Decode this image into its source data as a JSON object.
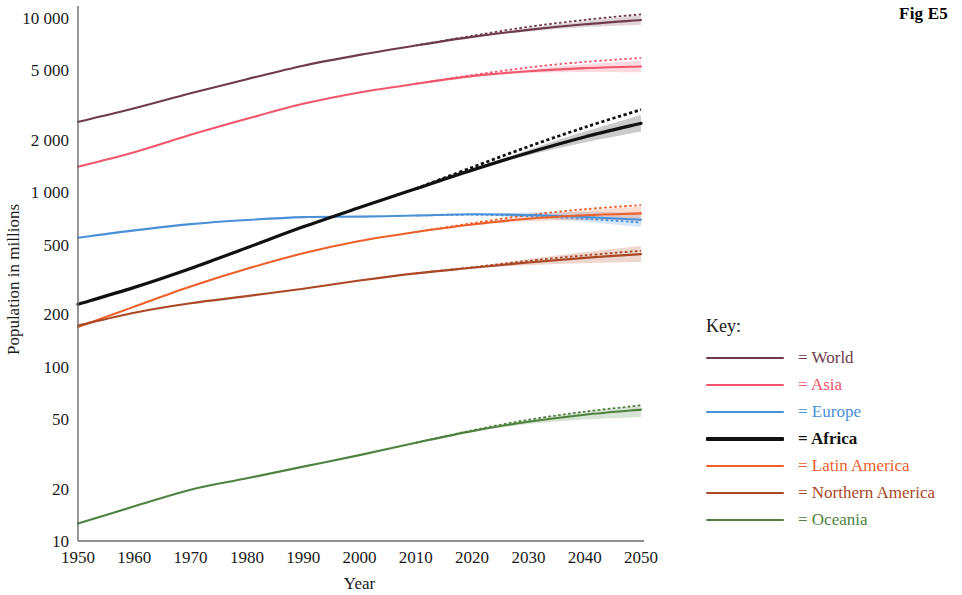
{
  "figure": {
    "label": "Fig E5"
  },
  "legend": {
    "title": "Key:",
    "prefix": "= ",
    "items": [
      {
        "label": "= World",
        "color": "#6e3b4b",
        "bold": false
      },
      {
        "label": "= Asia",
        "color": "#f2566d",
        "bold": false
      },
      {
        "label": "= Europe",
        "color": "#4a90d9",
        "bold": false
      },
      {
        "label": "= Africa",
        "color": "#111111",
        "bold": true
      },
      {
        "label": "= Latin America",
        "color": "#ee5f2a",
        "bold": false
      },
      {
        "label": "= Northern America",
        "color": "#ab4724",
        "bold": false
      },
      {
        "label": "= Oceania",
        "color": "#4f8241",
        "bold": false
      }
    ]
  },
  "chart_data": {
    "type": "line",
    "title": "",
    "xlabel": "Year",
    "ylabel": "Population in millions",
    "xlim": [
      1950,
      2050
    ],
    "ylim": [
      10,
      10000
    ],
    "yscale": "log",
    "grid": false,
    "legend_position": "right",
    "xticks": [
      1950,
      1960,
      1970,
      1980,
      1990,
      2000,
      2010,
      2020,
      2030,
      2040,
      2050
    ],
    "xticklabels": [
      "1950",
      "1960",
      "1970",
      "1980",
      "1990",
      "2000",
      "2010",
      "2020",
      "2030",
      "2040",
      "2050"
    ],
    "yticks": [
      10,
      20,
      50,
      100,
      200,
      500,
      1000,
      2000,
      5000,
      10000
    ],
    "yticklabels": [
      "10",
      "20",
      "50",
      "100",
      "200",
      "500",
      "1 000",
      "2 000",
      "5 000",
      "10 000"
    ],
    "x": [
      1950,
      1960,
      1970,
      1980,
      1990,
      2000,
      2010,
      2020,
      2030,
      2040,
      2050
    ],
    "projection_start_year": 2010,
    "series": [
      {
        "name": "World",
        "color": "#6e3b4b",
        "width": 2.1,
        "values": [
          2536,
          3035,
          3700,
          4458,
          5327,
          6143,
          6957,
          7795,
          8548,
          9199,
          9735
        ],
        "projected_alt": [
          null,
          null,
          null,
          null,
          null,
          null,
          6957,
          7900,
          8900,
          9750,
          10500
        ],
        "band_low": [
          null,
          null,
          null,
          null,
          null,
          null,
          6957,
          7780,
          8380,
          8850,
          9150
        ],
        "band_high": [
          null,
          null,
          null,
          null,
          null,
          null,
          6957,
          7820,
          8760,
          9620,
          10380
        ]
      },
      {
        "name": "Asia",
        "color": "#f2566d",
        "width": 2.1,
        "values": [
          1404,
          1700,
          2138,
          2642,
          3221,
          3741,
          4194,
          4641,
          4947,
          5155,
          5266
        ],
        "projected_alt": [
          null,
          null,
          null,
          null,
          null,
          null,
          4194,
          4700,
          5200,
          5600,
          5900
        ],
        "band_low": [
          null,
          null,
          null,
          null,
          null,
          null,
          4194,
          4620,
          4830,
          4900,
          4880
        ],
        "band_high": [
          null,
          null,
          null,
          null,
          null,
          null,
          4194,
          4660,
          5070,
          5420,
          5680
        ]
      },
      {
        "name": "Europe",
        "color": "#4a90d9",
        "width": 2.1,
        "values": [
          549,
          605,
          657,
          694,
          721,
          726,
          736,
          748,
          741,
          722,
          696
        ],
        "projected_alt": [
          null,
          null,
          null,
          null,
          null,
          null,
          736,
          744,
          730,
          705,
          672
        ],
        "band_low": [
          null,
          null,
          null,
          null,
          null,
          null,
          736,
          744,
          718,
          678,
          632
        ],
        "band_high": [
          null,
          null,
          null,
          null,
          null,
          null,
          736,
          752,
          766,
          770,
          766
        ]
      },
      {
        "name": "Africa",
        "color": "#111111",
        "width": 3.2,
        "values": [
          228,
          285,
          366,
          481,
          634,
          818,
          1049,
          1341,
          1688,
          2078,
          2489
        ],
        "projected_alt": [
          null,
          null,
          null,
          null,
          null,
          null,
          1049,
          1390,
          1830,
          2360,
          2980
        ],
        "band_low": [
          null,
          null,
          null,
          null,
          null,
          null,
          1049,
          1330,
          1630,
          1930,
          2230
        ],
        "band_high": [
          null,
          null,
          null,
          null,
          null,
          null,
          1049,
          1352,
          1750,
          2230,
          2780
        ]
      },
      {
        "name": "Latin America",
        "color": "#ee5f2a",
        "width": 2.1,
        "values": [
          169,
          221,
          288,
          364,
          447,
          526,
          592,
          654,
          706,
          739,
          757
        ],
        "projected_alt": [
          null,
          null,
          null,
          null,
          null,
          null,
          592,
          665,
          740,
          800,
          845
        ],
        "band_low": [
          null,
          null,
          null,
          null,
          null,
          null,
          592,
          648,
          682,
          694,
          692
        ],
        "band_high": [
          null,
          null,
          null,
          null,
          null,
          null,
          592,
          660,
          730,
          788,
          830
        ]
      },
      {
        "name": "Northern America",
        "color": "#ab4724",
        "width": 2.1,
        "values": [
          172,
          204,
          231,
          254,
          280,
          312,
          343,
          369,
          396,
          421,
          442
        ],
        "projected_alt": [
          null,
          null,
          null,
          null,
          null,
          null,
          343,
          372,
          404,
          435,
          462
        ],
        "band_low": [
          null,
          null,
          null,
          null,
          null,
          null,
          343,
          366,
          382,
          392,
          398
        ],
        "band_high": [
          null,
          null,
          null,
          null,
          null,
          null,
          343,
          374,
          414,
          454,
          492
        ]
      },
      {
        "name": "Oceania",
        "color": "#4f8241",
        "width": 2.1,
        "values": [
          12.6,
          15.8,
          19.7,
          22.9,
          26.7,
          31.1,
          36.6,
          42.7,
          48.3,
          53.0,
          56.7
        ],
        "projected_alt": [
          null,
          null,
          null,
          null,
          null,
          null,
          36.6,
          43.1,
          49.6,
          55.2,
          60.0
        ],
        "band_low": [
          null,
          null,
          null,
          null,
          null,
          null,
          36.6,
          42.4,
          46.9,
          49.8,
          51.5
        ],
        "band_high": [
          null,
          null,
          null,
          null,
          null,
          null,
          36.6,
          43.0,
          49.6,
          55.4,
          59.8
        ]
      }
    ]
  }
}
